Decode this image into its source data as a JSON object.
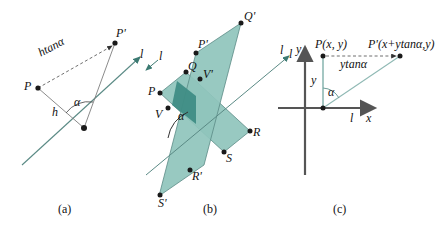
{
  "figure": {
    "caption_a": "(a)",
    "caption_b": "(b)",
    "caption_c": "(c)",
    "colors": {
      "line": "#5a8a85",
      "fill_light": "#8fc4bc",
      "fill_dark": "#3f8d85",
      "point": "#1a1a1a",
      "dashed": "#4a4a4a",
      "axis": "#555555",
      "background": "#ffffff"
    }
  },
  "panel_a": {
    "labels": {
      "P": "P",
      "P_prime": "P'",
      "h": "h",
      "htan": "htanα",
      "alpha": "α",
      "l": "l"
    }
  },
  "panel_b": {
    "labels": {
      "P": "P",
      "Q": "Q",
      "V": "V",
      "R": "R",
      "S": "S",
      "P_prime": "P'",
      "Q_prime": "Q'",
      "V_prime": "V'",
      "R_prime": "R'",
      "S_prime": "S'",
      "alpha": "α",
      "l": "l",
      "l2": "l"
    }
  },
  "panel_c": {
    "labels": {
      "point_P": "P(x, y)",
      "point_P_prime": "P'(x+ytanα,y)",
      "ytan": "ytanα",
      "y_side": "y",
      "y_axis": "y",
      "x_axis": "x",
      "l_axis": "l",
      "l_left": "l",
      "alpha": "α"
    }
  }
}
